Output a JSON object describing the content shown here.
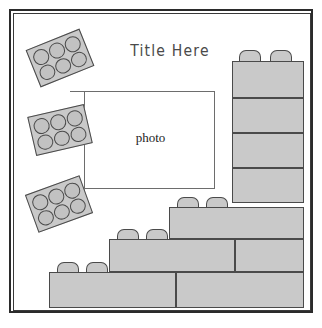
{
  "page": {
    "background_color": "#ffffff",
    "border_color": "#2b2b2b",
    "brick_fill": "#c9c9c9",
    "brick_stroke": "#4a4a4a"
  },
  "header": {
    "title": "Title Here"
  },
  "photo_placeholder": {
    "label": "photo"
  },
  "top_view_bricks": [
    {
      "name": "top-view-brick-1",
      "studs": 6,
      "left": 17,
      "top": 24,
      "rotation": -22
    },
    {
      "name": "top-view-brick-2",
      "studs": 6,
      "left": 17,
      "top": 96,
      "rotation": -13
    },
    {
      "name": "top-view-brick-3",
      "studs": 6,
      "left": 16,
      "top": 170,
      "rotation": -20
    }
  ],
  "side_view_bricks": [
    {
      "name": "column-brick-1",
      "left": 218,
      "top": 47,
      "width": 72,
      "height": 37,
      "studs": 2,
      "rows": 1
    },
    {
      "name": "column-brick-2",
      "left": 218,
      "top": 84,
      "width": 72,
      "height": 35,
      "studs": 0,
      "rows": 1
    },
    {
      "name": "column-brick-3",
      "left": 218,
      "top": 119,
      "width": 72,
      "height": 35,
      "studs": 0,
      "rows": 1
    },
    {
      "name": "column-brick-4",
      "left": 218,
      "top": 154,
      "width": 72,
      "height": 35,
      "studs": 0,
      "rows": 1
    },
    {
      "name": "column-brick-5",
      "left": 218,
      "top": 189,
      "width": 72,
      "height": 36,
      "studs": 0,
      "rows": 1
    },
    {
      "name": "step-brick-upper",
      "left": 155,
      "top": 193,
      "width": 135,
      "height": 32,
      "studs": 2,
      "rows": 1
    },
    {
      "name": "step-brick-middle",
      "left": 95,
      "top": 225,
      "width": 195,
      "height": 33,
      "studs": 2,
      "rows": 1
    },
    {
      "name": "bottom-brick-row",
      "left": 35,
      "top": 258,
      "width": 255,
      "height": 36,
      "studs": 2,
      "rows": 1
    }
  ],
  "legend": {
    "brick_note": "stacked lego brick illustration"
  }
}
